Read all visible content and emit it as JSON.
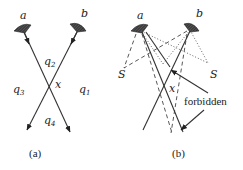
{
  "panel_a": {
    "caption": "(a)",
    "labels": {
      "a": "a",
      "b": "b",
      "x": "x",
      "q1": "q",
      "q1_sub": "1",
      "q2": "q",
      "q2_sub": "2",
      "q3": "q",
      "q3_sub": "3",
      "q4": "q",
      "q4_sub": "4"
    },
    "icons": [
      "mirror-a-icon",
      "mirror-b-icon"
    ]
  },
  "panel_b": {
    "caption": "(b)",
    "labels": {
      "a": "a",
      "b": "b",
      "x": "x",
      "s_left": "S",
      "s_right": "S",
      "forbidden": "forbidden"
    },
    "icons": [
      "mirror-a-icon",
      "mirror-b-icon"
    ]
  },
  "colors": {
    "ink": "#222222",
    "background": "#ffffff"
  }
}
